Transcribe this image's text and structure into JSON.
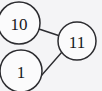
{
  "diagram": {
    "background_color": "#f4f4f6",
    "node_fill_color": "#fbfbfc",
    "stroke_color": "#2c2c30",
    "label_color": "#17171a",
    "nodes": [
      {
        "id": "node-10",
        "label": "10",
        "cx": 19,
        "cy": 23,
        "r": 21,
        "name": "graph-node-10"
      },
      {
        "id": "node-11",
        "label": "11",
        "cx": 77,
        "cy": 41,
        "r": 19,
        "name": "graph-node-11"
      },
      {
        "id": "node-1",
        "label": "1",
        "cx": 21,
        "cy": 71,
        "r": 21,
        "name": "graph-node-1"
      }
    ],
    "edges": [
      {
        "id": "edge-10-11",
        "from": "node-10",
        "to": "node-11",
        "x1": 39,
        "y1": 29,
        "x2": 60,
        "y2": 36,
        "name": "graph-edge-10-to-11"
      },
      {
        "id": "edge-1-11",
        "from": "node-1",
        "to": "node-11",
        "x1": 41,
        "y1": 76,
        "x2": 62,
        "y2": 52,
        "name": "graph-edge-1-to-11"
      }
    ]
  }
}
